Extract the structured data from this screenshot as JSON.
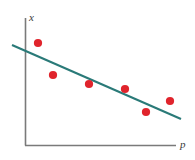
{
  "figure": {
    "width": 195,
    "height": 160,
    "background": "#ffffff"
  },
  "axes": {
    "x_axis_label": "p",
    "y_axis_label": "x",
    "axis_color": "#7a7a7a",
    "origin": {
      "x": 25,
      "y": 145
    },
    "y_axis_top": {
      "x": 25,
      "y": 18
    },
    "x_axis_right": {
      "x": 175,
      "y": 145
    }
  },
  "colors": {
    "point_color": "#e0242c",
    "line_color": "#2a7a78",
    "axis_color": "#7a7a7a",
    "label_color": "#3a3a3a"
  },
  "chart_data": {
    "type": "scatter",
    "title": "",
    "subtitle": "",
    "xlabel": "p",
    "ylabel": "x",
    "grid": false,
    "legend": false,
    "annotations": [],
    "xlim": [
      0,
      10
    ],
    "ylim": [
      0,
      10
    ],
    "xticks": [],
    "yticks": [],
    "series": [
      {
        "name": "observations",
        "type": "scatter",
        "color": "#e0242c",
        "marker": "circle",
        "marker_size": 6,
        "x": [
          1.0,
          2.0,
          4.5,
          7.0,
          8.5,
          10.0
        ],
        "y": [
          8.2,
          5.8,
          5.0,
          4.6,
          2.8,
          3.6
        ],
        "points_px": [
          {
            "x": 38,
            "y": 43
          },
          {
            "x": 53,
            "y": 75
          },
          {
            "x": 89,
            "y": 84
          },
          {
            "x": 125,
            "y": 89
          },
          {
            "x": 146,
            "y": 112
          },
          {
            "x": 170,
            "y": 101
          }
        ]
      },
      {
        "name": "trend-line",
        "type": "line",
        "color": "#2a7a78",
        "line_width": 2,
        "x": [
          -0.9,
          11.0
        ],
        "y": [
          8.0,
          2.1
        ],
        "endpoints_px": {
          "start": {
            "x": 12,
            "y": 45
          },
          "end": {
            "x": 181,
            "y": 119
          }
        },
        "slope_sign": "negative"
      }
    ]
  }
}
